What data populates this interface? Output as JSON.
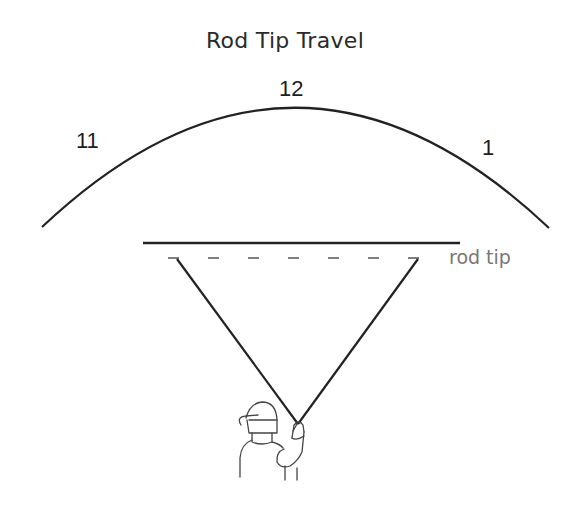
{
  "title": "Rod Tip Travel",
  "clock_labels": {
    "left": "11",
    "top": "12",
    "right": "1"
  },
  "annotations": {
    "rod_tip": "rod tip"
  },
  "colors": {
    "line": "#222222",
    "dash": "#555555",
    "label_gray": "#777777"
  }
}
